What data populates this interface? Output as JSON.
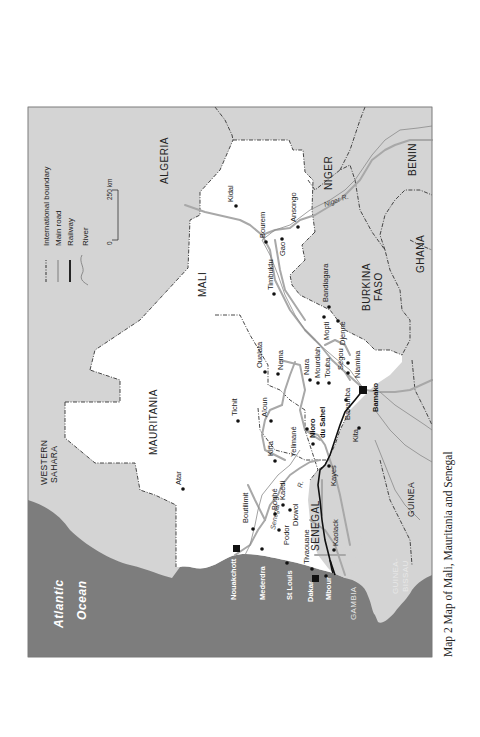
{
  "caption": "Map 2  Map of Mali, Mauritania and Senegal",
  "legend": {
    "items": [
      {
        "label": "International boundary",
        "symbol": "dash-dot-line"
      },
      {
        "label": "Main road",
        "symbol": "grey-line"
      },
      {
        "label": "Railway",
        "symbol": "black-line"
      },
      {
        "label": "River",
        "symbol": "thin-wavy-line"
      }
    ],
    "scale": {
      "start": "0",
      "end": "250 km"
    }
  },
  "ocean": {
    "line1": "Atlantic",
    "line2": "Ocean"
  },
  "countries": {
    "algeria": "ALGERIA",
    "niger": "NIGER",
    "benin": "BENIN",
    "mali": "MALI",
    "burkina_line1": "BURKINA",
    "burkina_line2": "FASO",
    "ghana": "GHANA",
    "mauritania": "MAURITANIA",
    "western_sahara_line1": "WESTERN",
    "western_sahara_line2": "SAHARA",
    "senegal": "SENEGAL",
    "guinea": "GUINEA",
    "gambia": "GAMBIA",
    "guinea_bissau_line1": "GUINEA-",
    "guinea_bissau_line2": "BISSAU"
  },
  "rivers": {
    "niger": "Niger R.",
    "senegal": "Senegal",
    "senegal_r": "R."
  },
  "capitals": {
    "nouakchott": "Nouakchott",
    "dakar": "Dakar",
    "bamako": "Bamako"
  },
  "towns": {
    "kidal": "Kidal",
    "bourem": "Bourem",
    "ansongo": "Ansongo",
    "gao": "Gao",
    "timbuktu": "Timbuktu",
    "bandiagara": "Bandiagara",
    "mopti": "Mopti",
    "djenne": "Djenne",
    "niamina": "Niamina",
    "segou": "Ségou",
    "touba": "Touba",
    "mourdiah": "Mourdiah",
    "nara": "Nara",
    "nema": "Nema",
    "oualata": "Oualata",
    "tichit": "Tichit",
    "aioun": "Aïoun",
    "banamba": "Banamba",
    "nioro_line1": "Nioro",
    "nioro_line2": "du Sahel",
    "kita": "Kita",
    "kiffa": "Kiffa",
    "yelimane": "Yelimané",
    "kayes": "Kayes",
    "atar": "Atar",
    "boutilimit": "Boutilimit",
    "boghe": "Boghé",
    "kaedi": "Kaédi",
    "diowol": "Diowol",
    "podor": "Podor",
    "tivaouane": "Tivaouane",
    "kaolack": "Kaolack",
    "mederdra": "Mederdra",
    "st_louis": "St Louis",
    "mbour": "Mbour"
  },
  "colors": {
    "ocean": "#7d7d7d",
    "neighbours": "#d4d4d4",
    "focus_countries": "#ffffff",
    "road": "#a8a8a8",
    "railway": "#111111",
    "border": "#333333"
  }
}
